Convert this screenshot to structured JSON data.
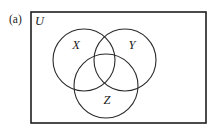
{
  "figure": {
    "part_label": "(a)",
    "universe_label": "U",
    "type": "three-set-venn-diagram",
    "frame": {
      "x": 31,
      "y": 12,
      "width": 175,
      "height": 111,
      "stroke_color": "#1f1f1f"
    },
    "circles": [
      {
        "label": "X",
        "cx": 84,
        "cy": 60,
        "r": 31,
        "label_x": 76,
        "label_y": 49,
        "stroke_color": "#2a2a2a"
      },
      {
        "label": "Y",
        "cx": 125,
        "cy": 60,
        "r": 31,
        "label_x": 132,
        "label_y": 49,
        "stroke_color": "#2a2a2a"
      },
      {
        "label": "Z",
        "cx": 106,
        "cy": 86,
        "r": 32,
        "label_x": 107,
        "label_y": 104,
        "stroke_color": "#2a2a2a"
      }
    ],
    "background_color": "#ffffff",
    "part_label_position": {
      "x": 9,
      "y": 23
    },
    "universe_label_position": {
      "x": 35,
      "y": 25
    }
  }
}
